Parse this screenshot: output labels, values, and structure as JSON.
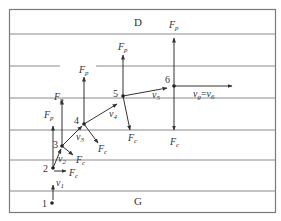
{
  "figure": {
    "top_label": "D",
    "bottom_label": "G",
    "border_color": "#7a7a7a",
    "line_color": "#8a8a8a",
    "ink_color": "#333333"
  },
  "points": [
    {
      "id": "1",
      "label": "1",
      "x": 52,
      "y": 203
    },
    {
      "id": "2",
      "label": "2",
      "x": 53,
      "y": 168
    },
    {
      "id": "3",
      "label": "3",
      "x": 62,
      "y": 146
    },
    {
      "id": "4",
      "label": "4",
      "x": 84,
      "y": 124
    },
    {
      "id": "5",
      "label": "5",
      "x": 123,
      "y": 96
    },
    {
      "id": "6",
      "label": "6",
      "x": 174,
      "y": 86
    }
  ],
  "labels": {
    "Fp": "F",
    "Fp_sub": "p",
    "Fc": "F",
    "Fc_sub": "c",
    "v": "v",
    "v1_sub": "1",
    "v2_sub": "2",
    "v3_sub": "3",
    "v4_sub": "4",
    "v5_sub": "5",
    "vg_sub": "g",
    "v6_sub": "6",
    "equals": "="
  }
}
